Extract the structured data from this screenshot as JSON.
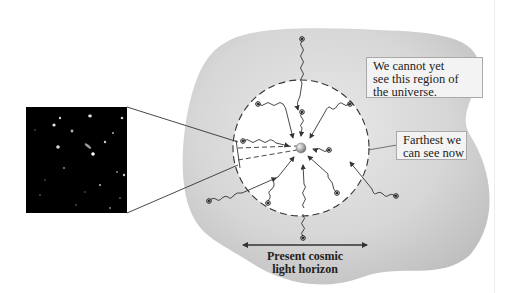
{
  "figure": {
    "labels": {
      "unobservable_region": [
        "We cannot yet",
        "see this region of",
        "the universe."
      ],
      "farthest_visible": [
        "Farthest we",
        "can see now"
      ],
      "horizon": [
        "Present cosmic",
        "light horizon"
      ]
    },
    "inset_image": {
      "description": "deep-field telescope image of distant galaxies"
    },
    "colors": {
      "universe_region": "#c9c9c9",
      "observable_region": "#ffffff",
      "inset_background": "#000000",
      "observer": "#9a9a9a",
      "lines": "#333333"
    }
  }
}
